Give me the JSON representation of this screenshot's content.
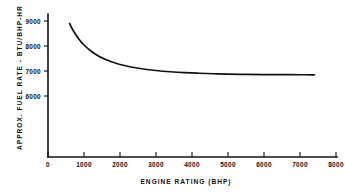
{
  "chart_data": {
    "type": "line",
    "title": "",
    "xlabel": "ENGINE RATING (BHP)",
    "ylabel": "APPROX. FUEL RATE - BTU/BHP-HR",
    "xlim": [
      0,
      8000
    ],
    "ylim": [
      5400,
      9400
    ],
    "grid": false,
    "legend": "none",
    "xticks": [
      0,
      1000,
      2000,
      3000,
      4000,
      5000,
      6000,
      7000,
      8000
    ],
    "xtick_labels": [
      "0",
      "1000",
      "2000",
      "3000",
      "4000",
      "5000",
      "6000",
      "7000",
      "8000"
    ],
    "yticks": [
      6000,
      7000,
      8000,
      9000
    ],
    "ytick_labels": [
      "6000",
      "7000",
      "8000",
      "9000"
    ],
    "series": [
      {
        "name": "Approximate fuel rate",
        "x": [
          600,
          700,
          800,
          900,
          1000,
          1200,
          1400,
          1600,
          1800,
          2000,
          2300,
          2600,
          3000,
          3400,
          3800,
          4200,
          4600,
          5000,
          5500,
          6000,
          6500,
          7000,
          7400
        ],
        "values": [
          8900,
          8620,
          8390,
          8200,
          8040,
          7790,
          7600,
          7460,
          7350,
          7260,
          7160,
          7090,
          7020,
          6970,
          6935,
          6910,
          6890,
          6875,
          6865,
          6858,
          6853,
          6850,
          6848
        ]
      }
    ]
  },
  "axes": {
    "x_title": "ENGINE RATING (BHP)",
    "y_title": "APPROX. FUEL RATE - BTU/BHP-HR"
  }
}
